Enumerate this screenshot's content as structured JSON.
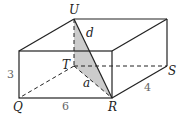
{
  "diagram": {
    "type": "rectangular-box",
    "vertices": {
      "U": "U",
      "T": "T",
      "S": "S",
      "Q": "Q",
      "R": "R"
    },
    "dimensions": {
      "height": "3",
      "length": "6",
      "width": "4"
    },
    "segments": {
      "diagonal": "d",
      "base_diagonal": "a"
    },
    "colors": {
      "edge": "#222222",
      "shade": "#cccccc",
      "dim_text": "#666666"
    }
  }
}
